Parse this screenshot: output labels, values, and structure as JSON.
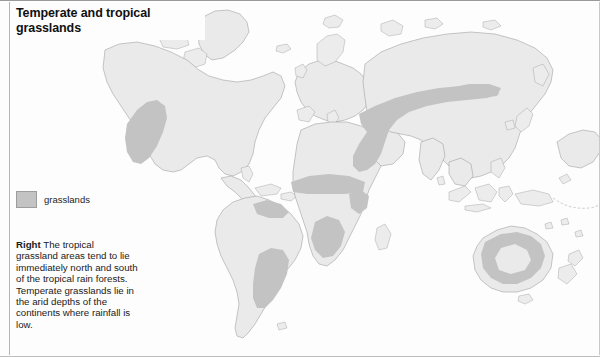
{
  "page": {
    "title": "Temperate and tropical grasslands"
  },
  "legend": {
    "swatch_label": "grasslands",
    "swatch_color": "#c3c3c3"
  },
  "caption": {
    "lead": "Right",
    "body": "The tropical grassland areas tend to lie immediately north and south of the tropical rain forests. Temperate grasslands lie in the arid depths of the continents where rainfall is low."
  },
  "map": {
    "type": "world-thematic-map",
    "projection": "world-equirectangular-like",
    "land_color": "#eaeaea",
    "coast_color": "#9b9b9b",
    "ocean_color": "#fdfdfd",
    "grassland_color": "#c3c3c3",
    "regions_shaded": [
      "North American Great Plains / Prairie",
      "South American Llanos",
      "South American Cerrado / Gran Chaco / Pampas",
      "African Sahel belt",
      "East African savanna",
      "Southern African savanna / Kalahari margin",
      "Eurasian Steppe belt",
      "Central Asian / Mongolian steppe",
      "Australian interior grassland ring"
    ]
  }
}
